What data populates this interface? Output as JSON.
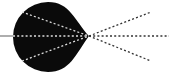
{
  "diagram": {
    "colors": {
      "background": "#ffffff",
      "body": "#0a0a0a",
      "inner_rays": "#dddddd",
      "outer_rays": "#333333",
      "axis_line": "#777777"
    },
    "body": {
      "cx": 48,
      "cy": 37,
      "r": 35,
      "tip_x": 89,
      "tip_y": 36
    },
    "focal_point": {
      "x": 89,
      "y": 36
    },
    "axis_line": {
      "x1": 0,
      "y1": 36,
      "x2": 13,
      "y2": 36
    },
    "inner_rays": [
      {
        "x1": 13,
        "y1": 36,
        "x2": 89,
        "y2": 36
      },
      {
        "x1": 22,
        "y1": 12,
        "x2": 89,
        "y2": 36
      },
      {
        "x1": 22,
        "y1": 61,
        "x2": 89,
        "y2": 36
      }
    ],
    "outer_rays": [
      {
        "x1": 89,
        "y1": 36,
        "x2": 151,
        "y2": 12
      },
      {
        "x1": 89,
        "y1": 36,
        "x2": 169,
        "y2": 36
      },
      {
        "x1": 89,
        "y1": 36,
        "x2": 151,
        "y2": 61
      }
    ]
  }
}
